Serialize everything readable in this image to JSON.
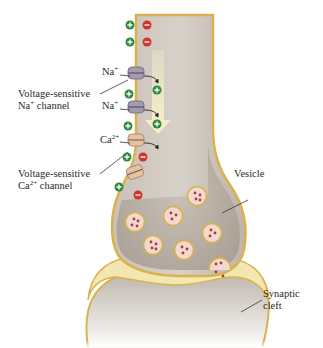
{
  "labels": {
    "na_ion_1": {
      "base": "Na",
      "sup": "+"
    },
    "na_ion_2": {
      "base": "Na",
      "sup": "+"
    },
    "ca_ion": {
      "base": "Ca",
      "sup": "2+"
    },
    "na_channel_line1": "Voltage-sensitive",
    "na_channel_line2": {
      "base": "Na",
      "sup": "+",
      "rest": " channel"
    },
    "ca_channel_line1": "Voltage-sensitive",
    "ca_channel_line2": {
      "base": "Ca",
      "sup": "2+",
      "rest": " channel"
    },
    "vesicle": "Vesicle",
    "synaptic_cleft_line1": "Synaptic",
    "synaptic_cleft_line2": "cleft"
  },
  "charges": {
    "positive_symbol": "+",
    "negative_symbol": "−"
  },
  "colors": {
    "positive": "#2e8b3e",
    "negative": "#d6312b",
    "membrane": "#d9b24e",
    "cytoplasm": "#b8b0a6",
    "extracellular_fluid": "#f3e6b0",
    "na_channel": "#a49bb0",
    "ca_channel": "#e3c3a4",
    "vesicle_fill": "#f1d9cf",
    "neurotransmitter": "#b03a36"
  }
}
